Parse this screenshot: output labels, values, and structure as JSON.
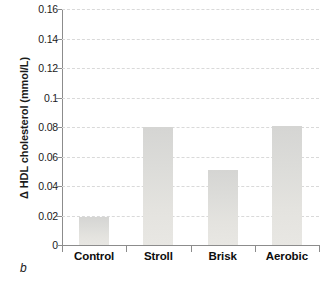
{
  "panel": {
    "letter": "b"
  },
  "chart_data": {
    "type": "bar",
    "title": "",
    "subtitle": "",
    "xlabel": "",
    "ylabel": "Δ HDL cholesterol (mmol/L)",
    "categories": [
      "Control",
      "Stroll",
      "Brisk",
      "Aerobic"
    ],
    "values": [
      0.019,
      0.08,
      0.051,
      0.081
    ],
    "series": [
      {
        "name": "Δ HDL cholesterol",
        "values": [
          0.019,
          0.08,
          0.051,
          0.081
        ]
      }
    ],
    "ylim": [
      0,
      0.16
    ],
    "ytick_values": [
      0,
      0.02,
      0.04,
      0.06,
      0.08,
      0.1,
      0.12,
      0.14,
      0.16
    ],
    "ytick_labels": [
      "0",
      "0.02",
      "0.04",
      "0.06",
      "0.08",
      "0.1",
      "0.12",
      "0.14",
      "0.16"
    ],
    "grid": {
      "horizontal": true,
      "vertical": false,
      "style": "dashed"
    },
    "legend": {
      "visible": false,
      "position": "none",
      "entries": []
    },
    "annotations": [],
    "colors": {
      "bar_fill": "#dedddA",
      "bar_fill_top": "#d5d5d3",
      "gridline": "#d9d9d9",
      "axis": "#8c8c8c",
      "text": "#1a1a1a",
      "background": "#ffffff"
    }
  }
}
